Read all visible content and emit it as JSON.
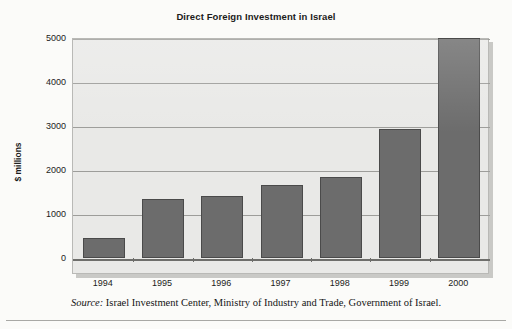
{
  "chart_data": {
    "type": "bar",
    "title": "Direct Foreign Investment in Israel",
    "xlabel": "",
    "ylabel": "$ millions",
    "categories": [
      "1994",
      "1995",
      "1996",
      "1997",
      "1998",
      "1999",
      "2000"
    ],
    "values": [
      450,
      1340,
      1410,
      1650,
      1850,
      2930,
      5000
    ],
    "yticks": [
      0,
      1000,
      2000,
      3000,
      4000,
      5000
    ],
    "ytick_labels": [
      "0",
      "1000",
      "2000",
      "3000",
      "4000",
      "5000"
    ],
    "ylim": [
      0,
      5000
    ],
    "grid": "horizontal",
    "legend": "none",
    "bar_color": "#6c6c6c",
    "bar_edge_color": "#4a4a4a",
    "plot_background": "#e9e9e7",
    "gridline_color": "#9d9d9a",
    "series": [
      {
        "name": "Direct Foreign Investment",
        "values": [
          450,
          1340,
          1410,
          1650,
          1850,
          2930,
          5000
        ]
      }
    ]
  },
  "source": {
    "label": "Source:",
    "text": " Israel Investment Center, Ministry of Industry and Trade, Government of Israel."
  }
}
